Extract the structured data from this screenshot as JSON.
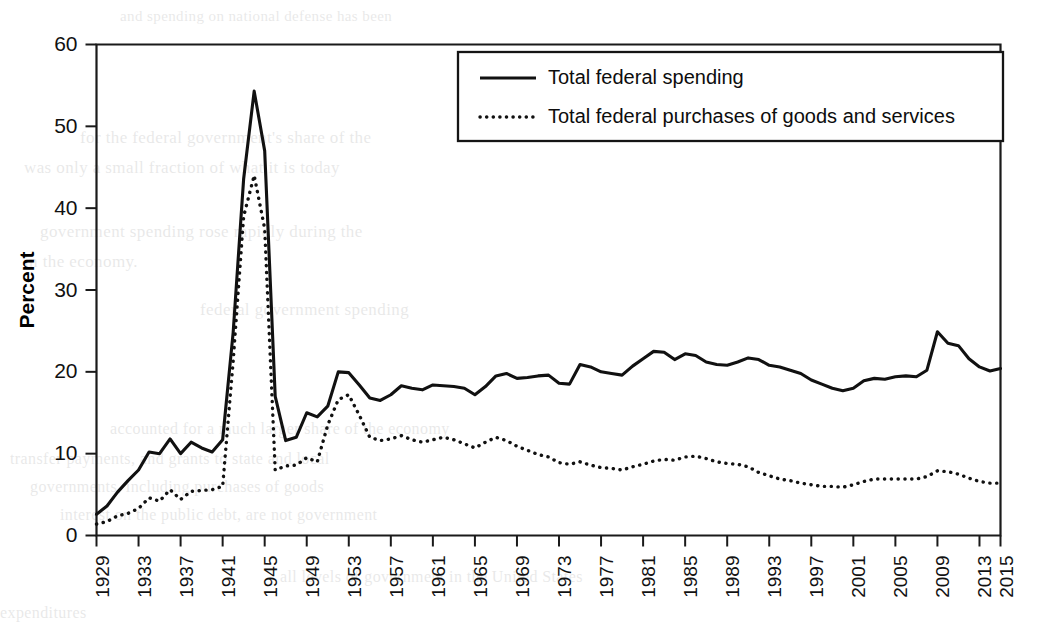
{
  "figure": {
    "width": 1037,
    "height": 628,
    "background": "#ffffff",
    "ink_color": "#111111"
  },
  "ghost_text": [
    {
      "text": "and spending on national defense has been",
      "x": 120,
      "y": 8,
      "size": 15
    },
    {
      "text": "for the federal government's share of the",
      "x": 80,
      "y": 128,
      "size": 17
    },
    {
      "text": "was only a small fraction of what it is today",
      "x": 24,
      "y": 158,
      "size": 17
    },
    {
      "text": "government spending rose rapidly during the",
      "x": 40,
      "y": 222,
      "size": 17
    },
    {
      "text": "in the economy.",
      "x": 24,
      "y": 252,
      "size": 17
    },
    {
      "text": "federal government spending",
      "x": 200,
      "y": 300,
      "size": 17
    },
    {
      "text": "accounted for a much larger share of the economy",
      "x": 110,
      "y": 420,
      "size": 16
    },
    {
      "text": "transfer payments, and grants to state and local",
      "x": 10,
      "y": 450,
      "size": 16
    },
    {
      "text": "governments, including purchases of goods",
      "x": 30,
      "y": 478,
      "size": 16
    },
    {
      "text": "interest on the public debt, are not government",
      "x": 60,
      "y": 506,
      "size": 16
    },
    {
      "text": "all levels of government in the United States",
      "x": 280,
      "y": 568,
      "size": 16
    },
    {
      "text": "expenditures",
      "x": 0,
      "y": 604,
      "size": 16
    }
  ],
  "chart_data": {
    "type": "line",
    "title": "",
    "xlabel": "",
    "ylabel": "Percent",
    "xlim": [
      1929,
      2015
    ],
    "ylim": [
      0,
      60
    ],
    "ytick_step": 10,
    "yticks": [
      0,
      10,
      20,
      30,
      40,
      50,
      60
    ],
    "xticks": [
      1929,
      1933,
      1937,
      1941,
      1945,
      1949,
      1953,
      1957,
      1961,
      1965,
      1969,
      1973,
      1977,
      1981,
      1985,
      1989,
      1993,
      1997,
      2001,
      2005,
      2009,
      2013,
      2015
    ],
    "grid": false,
    "legend_position": "top-right",
    "x": [
      1929,
      1930,
      1931,
      1932,
      1933,
      1934,
      1935,
      1936,
      1937,
      1938,
      1939,
      1940,
      1941,
      1942,
      1943,
      1944,
      1945,
      1946,
      1947,
      1948,
      1949,
      1950,
      1951,
      1952,
      1953,
      1954,
      1955,
      1956,
      1957,
      1958,
      1959,
      1960,
      1961,
      1962,
      1963,
      1964,
      1965,
      1966,
      1967,
      1968,
      1969,
      1970,
      1971,
      1972,
      1973,
      1974,
      1975,
      1976,
      1977,
      1978,
      1979,
      1980,
      1981,
      1982,
      1983,
      1984,
      1985,
      1986,
      1987,
      1988,
      1989,
      1990,
      1991,
      1992,
      1993,
      1994,
      1995,
      1996,
      1997,
      1998,
      1999,
      2000,
      2001,
      2002,
      2003,
      2004,
      2005,
      2006,
      2007,
      2008,
      2009,
      2010,
      2011,
      2012,
      2013,
      2014,
      2015
    ],
    "series": [
      {
        "name": "Total federal spending",
        "style": "solid",
        "values": [
          2.6,
          3.6,
          5.3,
          6.7,
          8.0,
          10.2,
          10.0,
          11.8,
          10.0,
          11.4,
          10.7,
          10.2,
          11.7,
          24.8,
          43.6,
          54.3,
          47.0,
          17.0,
          11.6,
          12.0,
          15.0,
          14.5,
          15.8,
          20.0,
          19.9,
          18.4,
          16.8,
          16.5,
          17.2,
          18.3,
          18.0,
          17.8,
          18.4,
          18.3,
          18.2,
          18.0,
          17.2,
          18.2,
          19.5,
          19.8,
          19.2,
          19.3,
          19.5,
          19.6,
          18.6,
          18.5,
          20.9,
          20.6,
          20.0,
          19.8,
          19.6,
          20.7,
          21.6,
          22.5,
          22.4,
          21.5,
          22.2,
          22.0,
          21.2,
          20.9,
          20.8,
          21.2,
          21.7,
          21.5,
          20.8,
          20.6,
          20.2,
          19.8,
          19.0,
          18.5,
          18.0,
          17.7,
          18.0,
          18.9,
          19.2,
          19.1,
          19.4,
          19.5,
          19.4,
          20.2,
          24.9,
          23.5,
          23.2,
          21.6,
          20.6,
          20.1,
          20.4
        ]
      },
      {
        "name": "Total federal purchases of goods and services",
        "style": "dotted",
        "values": [
          1.4,
          1.7,
          2.4,
          2.7,
          3.3,
          4.6,
          4.2,
          5.6,
          4.4,
          5.4,
          5.5,
          5.6,
          6.0,
          21.3,
          39.0,
          44.0,
          37.5,
          8.0,
          8.5,
          8.6,
          9.5,
          9.0,
          13.5,
          16.6,
          17.2,
          14.7,
          12.0,
          11.6,
          11.8,
          12.2,
          11.7,
          11.4,
          11.7,
          12.0,
          11.7,
          11.2,
          10.7,
          11.4,
          12.0,
          11.6,
          10.9,
          10.4,
          9.9,
          9.6,
          8.9,
          8.7,
          9.0,
          8.6,
          8.3,
          8.2,
          8.0,
          8.4,
          8.7,
          9.1,
          9.3,
          9.2,
          9.6,
          9.7,
          9.4,
          9.0,
          8.8,
          8.7,
          8.4,
          7.7,
          7.3,
          6.9,
          6.7,
          6.4,
          6.2,
          6.0,
          6.0,
          5.9,
          6.2,
          6.6,
          6.9,
          6.9,
          6.9,
          6.9,
          6.9,
          7.2,
          7.9,
          7.8,
          7.5,
          7.0,
          6.6,
          6.4,
          6.4
        ]
      }
    ],
    "legend": [
      {
        "label": "Total federal spending",
        "style": "solid"
      },
      {
        "label": "Total federal purchases of goods and services",
        "style": "dotted"
      }
    ]
  }
}
